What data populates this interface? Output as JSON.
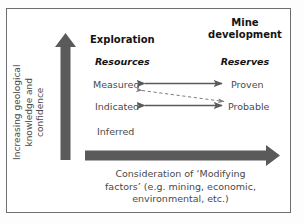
{
  "diagram": {
    "title_left": "Exploration",
    "title_right_line1": "Mine",
    "title_right_line2": "development",
    "subtitle_left": "Resources",
    "subtitle_right": "Reserves",
    "resource_categories": [
      "Measured",
      "Indicated",
      "Inferred"
    ],
    "reserve_categories": [
      "Proven",
      "Probable"
    ],
    "labels": {
      "measured": "Measured",
      "indicated": "Indicated",
      "inferred": "Inferred",
      "proven": "Proven",
      "probable": "Probable"
    },
    "y_axis_caption_line1": "Increasing geological",
    "y_axis_caption_line2": "knowledge and",
    "y_axis_caption_line3": "confidence",
    "x_axis_caption_line1": "Consideration of ‘Modifying",
    "x_axis_caption_line2": "factors’ (e.g. mining, economic,",
    "x_axis_caption_line3": "environmental, etc.)",
    "colors": {
      "block_arrow": "#5a5a5a",
      "thin_arrow": "#5a5a5a",
      "dashed_arrow": "#7d7d7d",
      "border": "#6e6e6e",
      "body_text": "#4a4a4a",
      "heading_text": "#141414"
    }
  }
}
